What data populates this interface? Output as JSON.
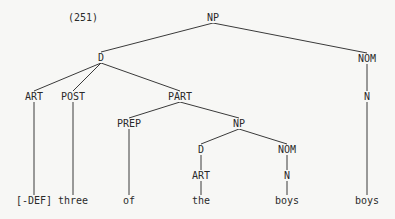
{
  "example_number": "(251)",
  "line_color": "#3a3a3a",
  "nodes": [
    {
      "id": "np-root",
      "label": "NP",
      "x": 213,
      "y": 18
    },
    {
      "id": "d-top",
      "label": "D",
      "x": 101,
      "y": 58
    },
    {
      "id": "nom-top",
      "label": "NOM",
      "x": 367,
      "y": 59
    },
    {
      "id": "art-left",
      "label": "ART",
      "x": 34,
      "y": 97
    },
    {
      "id": "post",
      "label": "POST",
      "x": 73,
      "y": 97
    },
    {
      "id": "part",
      "label": "PART",
      "x": 180,
      "y": 97
    },
    {
      "id": "n-right",
      "label": "N",
      "x": 367,
      "y": 97
    },
    {
      "id": "prep",
      "label": "PREP",
      "x": 129,
      "y": 124
    },
    {
      "id": "np-mid",
      "label": "NP",
      "x": 239,
      "y": 124
    },
    {
      "id": "d-mid",
      "label": "D",
      "x": 201,
      "y": 150
    },
    {
      "id": "nom-mid",
      "label": "NOM",
      "x": 287,
      "y": 150
    },
    {
      "id": "art-mid",
      "label": "ART",
      "x": 201,
      "y": 176
    },
    {
      "id": "n-mid",
      "label": "N",
      "x": 287,
      "y": 176
    },
    {
      "id": "leaf-def",
      "label": "[-DEF]",
      "x": 34,
      "y": 201
    },
    {
      "id": "leaf-three",
      "label": "three",
      "x": 73,
      "y": 201
    },
    {
      "id": "leaf-of",
      "label": "of",
      "x": 129,
      "y": 201
    },
    {
      "id": "leaf-the",
      "label": "the",
      "x": 201,
      "y": 201
    },
    {
      "id": "leaf-boys-1",
      "label": "boys",
      "x": 287,
      "y": 201
    },
    {
      "id": "leaf-boys-2",
      "label": "boys",
      "x": 367,
      "y": 201
    }
  ],
  "edges": [
    [
      "np-root",
      "d-top"
    ],
    [
      "np-root",
      "nom-top"
    ],
    [
      "d-top",
      "art-left"
    ],
    [
      "d-top",
      "post"
    ],
    [
      "d-top",
      "part"
    ],
    [
      "nom-top",
      "n-right"
    ],
    [
      "art-left",
      "leaf-def"
    ],
    [
      "post",
      "leaf-three"
    ],
    [
      "part",
      "prep"
    ],
    [
      "part",
      "np-mid"
    ],
    [
      "n-right",
      "leaf-boys-2"
    ],
    [
      "prep",
      "leaf-of"
    ],
    [
      "np-mid",
      "d-mid"
    ],
    [
      "np-mid",
      "nom-mid"
    ],
    [
      "d-mid",
      "art-mid"
    ],
    [
      "nom-mid",
      "n-mid"
    ],
    [
      "art-mid",
      "leaf-the"
    ],
    [
      "n-mid",
      "leaf-boys-1"
    ]
  ]
}
